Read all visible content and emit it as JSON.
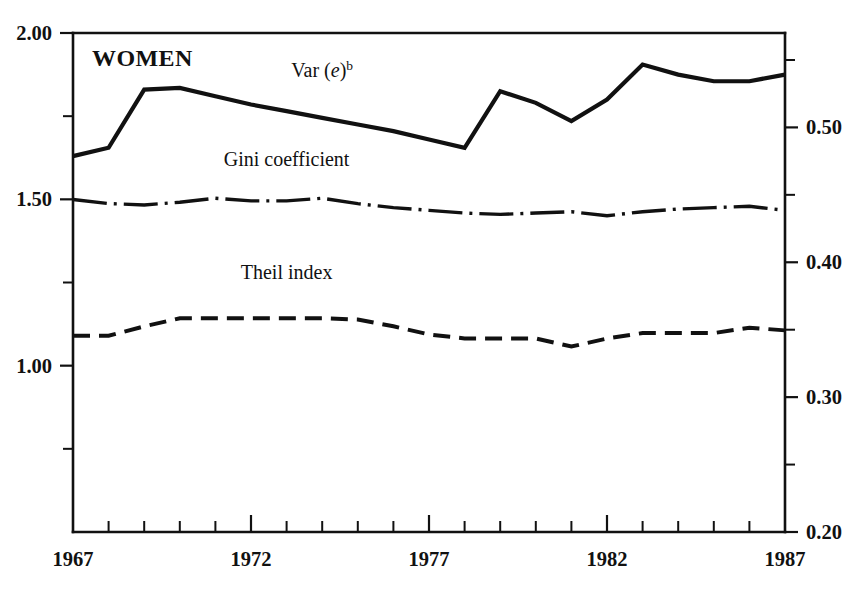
{
  "chart_data": {
    "type": "line",
    "title": "WOMEN",
    "xlabel": "",
    "ylabel": "",
    "grid": false,
    "legend_position": "inline-annotations",
    "x": [
      1967,
      1968,
      1969,
      1970,
      1971,
      1972,
      1973,
      1974,
      1975,
      1976,
      1977,
      1978,
      1979,
      1980,
      1981,
      1982,
      1983,
      1984,
      1985,
      1986,
      1987
    ],
    "xlim": [
      1967,
      1987
    ],
    "x_tick_labels": [
      "1967",
      "1972",
      "1977",
      "1982",
      "1987"
    ],
    "x_major_ticks": [
      1967,
      1972,
      1977,
      1982,
      1987
    ],
    "x_minor_ticks": [
      1968,
      1969,
      1970,
      1971,
      1973,
      1974,
      1975,
      1976,
      1978,
      1979,
      1980,
      1981,
      1983,
      1984,
      1985,
      1986
    ],
    "left_axis": {
      "label": "",
      "ylim": [
        0.5,
        2.0
      ],
      "tick_labels": [
        "2.00",
        "1.50",
        "1.00"
      ],
      "tick_values": [
        2.0,
        1.5,
        1.0
      ],
      "minor_tick_values": [
        1.75,
        1.25,
        0.75
      ]
    },
    "right_axis": {
      "label": "",
      "ylim": [
        0.2,
        0.57
      ],
      "tick_labels": [
        "0.50",
        "0.40",
        "0.30",
        "0.20"
      ],
      "tick_values": [
        0.5,
        0.4,
        0.3,
        0.2
      ],
      "minor_tick_values": [
        0.55,
        0.45,
        0.35,
        0.25
      ]
    },
    "series": [
      {
        "name": "Var (e)",
        "name_superscript": "b",
        "axis": "left",
        "style": "solid",
        "label_x": 1974,
        "label_y": 1.885,
        "values": [
          1.63,
          1.655,
          1.83,
          1.835,
          1.81,
          1.785,
          1.765,
          1.745,
          1.725,
          1.705,
          1.68,
          1.655,
          1.825,
          1.79,
          1.735,
          1.8,
          1.905,
          1.875,
          1.855,
          1.855,
          1.875
        ]
      },
      {
        "name": "Gini coefficient",
        "axis": "right",
        "style": "dash-dot",
        "label_x": 1973,
        "label_y": 0.476,
        "values": [
          0.4465,
          0.4435,
          0.4425,
          0.4445,
          0.4475,
          0.4455,
          0.4455,
          0.4475,
          0.4435,
          0.4405,
          0.4385,
          0.4365,
          0.4355,
          0.4365,
          0.4375,
          0.4345,
          0.4375,
          0.4395,
          0.4405,
          0.4415,
          0.4385
        ]
      },
      {
        "name": "Theil index",
        "axis": "right",
        "style": "dashed",
        "label_x": 1973,
        "label_y": 0.392,
        "values": [
          0.3455,
          0.3455,
          0.3525,
          0.3585,
          0.3585,
          0.3585,
          0.3585,
          0.3585,
          0.3575,
          0.3525,
          0.3465,
          0.3435,
          0.3435,
          0.3435,
          0.3375,
          0.3435,
          0.3475,
          0.3475,
          0.3475,
          0.3515,
          0.3495
        ]
      }
    ]
  },
  "annotations": {
    "panel_title": "WOMEN",
    "var_label_main": "Var (",
    "var_label_italic": "e",
    "var_label_close": ")",
    "var_label_sup": "b",
    "gini_label": "Gini coefficient",
    "theil_label": "Theil index"
  },
  "colors": {
    "ink": "#111111",
    "background": "#ffffff"
  }
}
